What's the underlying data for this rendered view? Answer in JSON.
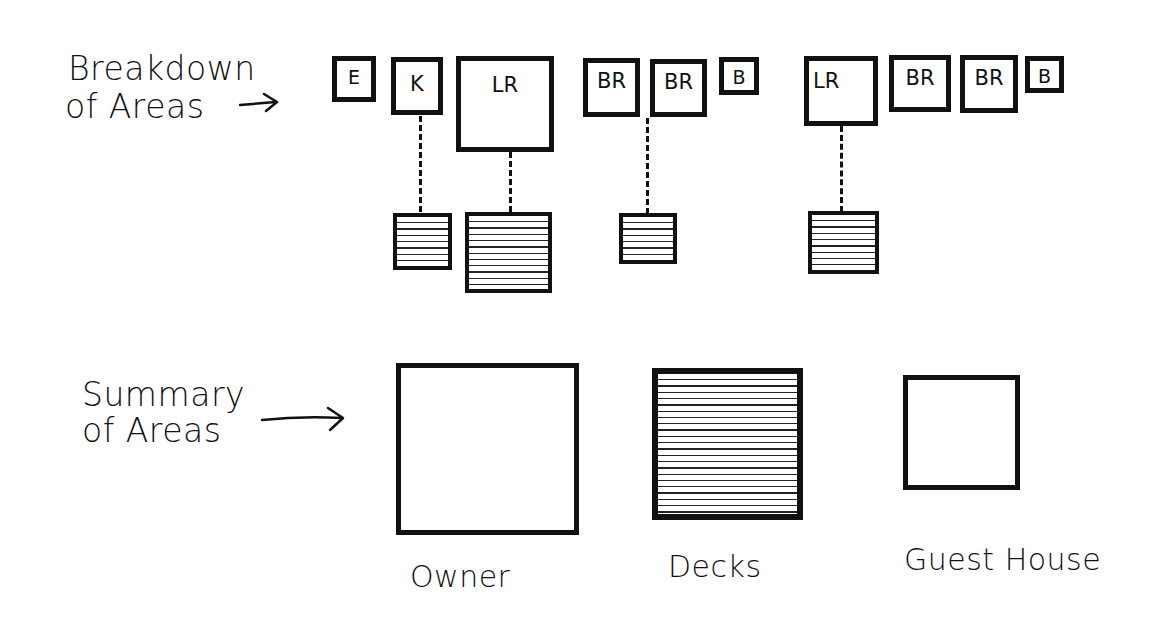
{
  "breakdown": {
    "label_line1": "Breakdown",
    "label_line2": "of Areas",
    "arrow_icon": "right-arrow-icon",
    "groups": [
      {
        "name": "Owner",
        "rooms": [
          {
            "tag": "E",
            "hatched_child": false
          },
          {
            "tag": "K",
            "hatched_child": true
          },
          {
            "tag": "LR",
            "hatched_child": true
          }
        ]
      },
      {
        "name": "Bedroom wing",
        "rooms": [
          {
            "tag": "BR",
            "hatched_child": true
          },
          {
            "tag": "BR",
            "hatched_child": false
          },
          {
            "tag": "B",
            "hatched_child": false
          }
        ]
      },
      {
        "name": "Guest House",
        "rooms": [
          {
            "tag": "LR",
            "hatched_child": true
          },
          {
            "tag": "BR",
            "hatched_child": false
          },
          {
            "tag": "BR",
            "hatched_child": false
          },
          {
            "tag": "B",
            "hatched_child": false
          }
        ]
      }
    ]
  },
  "summary": {
    "label_line1": "Summary",
    "label_line2": "of Areas",
    "arrow_icon": "right-arrow-icon",
    "blocks": [
      {
        "caption": "Owner",
        "fill": "empty"
      },
      {
        "caption": "Decks",
        "fill": "hatched"
      },
      {
        "caption": "Guest House",
        "fill": "empty"
      }
    ]
  },
  "colors": {
    "ink": "#111111",
    "paper": "#ffffff"
  }
}
